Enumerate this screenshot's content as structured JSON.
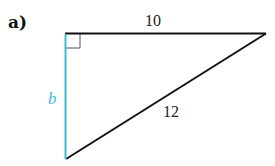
{
  "problem": {
    "part_label": "a)"
  },
  "triangle": {
    "top_side_label": "10",
    "hypotenuse_label": "12",
    "vertical_side_label": "b",
    "right_angle_marker": true
  },
  "colors": {
    "line": "#111111",
    "highlight": "#3fb8d8"
  }
}
